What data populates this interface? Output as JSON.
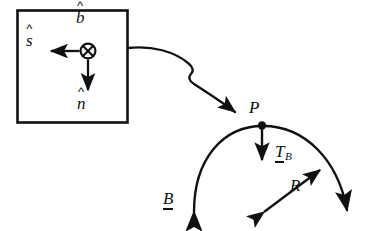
{
  "figure": {
    "type": "physics-vector-diagram",
    "background_color": "#ffffff",
    "ink_color": "#111111",
    "inset_box": {
      "name": "frenet-frame-inset",
      "border_color": "#111111",
      "center_symbol": "circle-x",
      "center_symbol_meaning": "vector-into-page",
      "labels": {
        "binormal": "b",
        "binormal_accent": "^",
        "tangent": "s",
        "tangent_accent": "^",
        "normal": "n",
        "normal_accent": "^"
      },
      "arrows": [
        {
          "name": "s-hat-arrow",
          "direction": "left"
        },
        {
          "name": "n-hat-arrow",
          "direction": "down"
        }
      ]
    },
    "trajectory": {
      "name": "curve-B",
      "label": "B",
      "label_style": "underlined-vector",
      "point_label": "P",
      "radius_label": "R",
      "tangent_vector_label": "T",
      "tangent_vector_subscript": "B",
      "tangent_vector_style": "underlined-vector",
      "arrow_ends": [
        "lower-left",
        "right-up"
      ]
    },
    "leader_line": {
      "name": "inset-to-point-leader",
      "style": "kinked",
      "points_to": "P"
    }
  }
}
